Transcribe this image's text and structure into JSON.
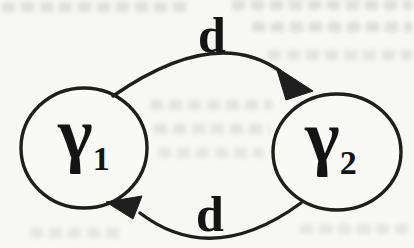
{
  "figure": {
    "kind": "two-state transition diagram (scanned book figure)",
    "nodes": [
      {
        "id": "gamma-1",
        "label": "γ",
        "subscript": "1"
      },
      {
        "id": "gamma-2",
        "label": "γ",
        "subscript": "2"
      }
    ],
    "edges": [
      {
        "from": "gamma-1",
        "to": "gamma-2",
        "label": "d",
        "position": "top"
      },
      {
        "from": "gamma-2",
        "to": "gamma-1",
        "label": "d",
        "position": "bottom"
      }
    ],
    "colors": {
      "ink": "#1e1e1e",
      "paper": "#f7f7f4"
    }
  }
}
